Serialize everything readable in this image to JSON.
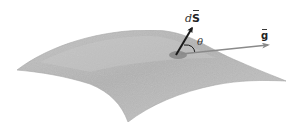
{
  "diagram": {
    "labels": {
      "area_vector": "d",
      "area_vector_symbol": "S",
      "angle": "θ",
      "field_vector": "g"
    },
    "colors": {
      "surface_fill": "#b9b9b9",
      "surface_highlight": "#d2d2d2",
      "surface_edge": "#a6a6a6",
      "patch": "#8d8d8d",
      "ds_arrow": "#1a1a1a",
      "g_arrow": "#8a8a8a",
      "text": "#222222",
      "background": "#ffffff"
    }
  }
}
